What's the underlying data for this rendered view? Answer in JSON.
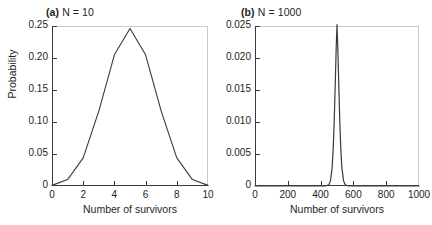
{
  "figure": {
    "background": "#ffffff",
    "curve_color": "#3a3a3a",
    "axis_color": "#3a3a3a",
    "frame_light_color": "#c9c9c9"
  },
  "panels": [
    {
      "id": "a",
      "label_prefix": "(a)",
      "label_text": "N = 10",
      "xlabel": "Number of survivors",
      "ylabel": "Probability",
      "xticks": [
        "0",
        "2",
        "4",
        "6",
        "8",
        "10"
      ],
      "yticks": [
        "0",
        "0.05",
        "0.10",
        "0.15",
        "0.20",
        "0.25"
      ]
    },
    {
      "id": "b",
      "label_prefix": "(b)",
      "label_text": "N = 1000",
      "xlabel": "Number of survivors",
      "ylabel": "",
      "xticks": [
        "0",
        "200",
        "400",
        "600",
        "800",
        "1000"
      ],
      "yticks": [
        "0",
        "0.005",
        "0.010",
        "0.015",
        "0.020",
        "0.025"
      ]
    }
  ],
  "chart_data": [
    {
      "type": "line",
      "title": "(a) N = 10",
      "xlabel": "Number of survivors",
      "ylabel": "Probability",
      "xlim": [
        0,
        10
      ],
      "ylim": [
        0,
        0.25
      ],
      "xticks": [
        0,
        2,
        4,
        6,
        8,
        10
      ],
      "yticks": [
        0,
        0.05,
        0.1,
        0.15,
        0.2,
        0.25
      ],
      "grid": false,
      "legend": "none",
      "distribution": "binomial N=10 p=0.5",
      "x": [
        0,
        1,
        2,
        3,
        4,
        5,
        6,
        7,
        8,
        9,
        10
      ],
      "values": [
        0.001,
        0.01,
        0.044,
        0.117,
        0.205,
        0.246,
        0.205,
        0.117,
        0.044,
        0.01,
        0.001
      ]
    },
    {
      "type": "line",
      "title": "(b) N = 1000",
      "xlabel": "Number of survivors",
      "ylabel": "Probability",
      "xlim": [
        0,
        1000
      ],
      "ylim": [
        0,
        0.025
      ],
      "xticks": [
        0,
        200,
        400,
        600,
        800,
        1000
      ],
      "yticks": [
        0,
        0.005,
        0.01,
        0.015,
        0.02,
        0.025
      ],
      "grid": false,
      "legend": "none",
      "distribution": "binomial N=1000 p=0.5",
      "x": [
        0,
        400,
        430,
        450,
        460,
        470,
        475,
        480,
        485,
        490,
        495,
        500,
        505,
        510,
        515,
        520,
        525,
        530,
        540,
        550,
        570,
        600,
        1000
      ],
      "values": [
        0.0,
        0.0,
        1e-05,
        0.0002,
        0.0008,
        0.0028,
        0.0049,
        0.0079,
        0.0119,
        0.0166,
        0.0215,
        0.0252,
        0.0215,
        0.0166,
        0.0119,
        0.0079,
        0.0049,
        0.0028,
        0.0008,
        0.0002,
        1e-05,
        0.0,
        0.0
      ]
    }
  ]
}
